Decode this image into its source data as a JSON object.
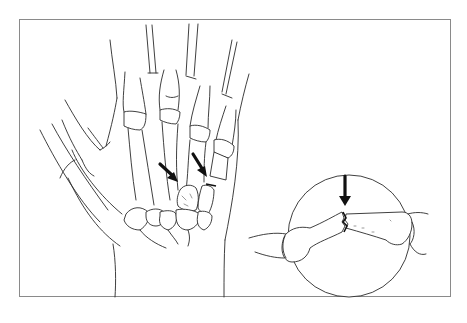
{
  "figure": {
    "colors": {
      "line": "#2a2a2a",
      "frame": "#8a8a8a",
      "background": "#ffffff",
      "arrow": "#111111"
    },
    "main_view": {
      "description": "Palmar view of hand bones with two arrows pointing at fracture sites",
      "arrows": 2
    },
    "inset": {
      "shape": "circle",
      "description": "Magnified lateral view of fractured bone",
      "arrows": 1
    }
  }
}
